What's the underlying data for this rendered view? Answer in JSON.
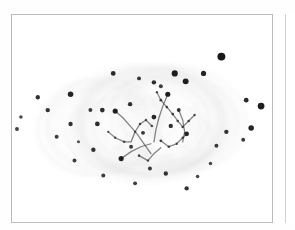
{
  "figure": {
    "title": "",
    "caption": "",
    "background_color": "#ffffff",
    "frame_color": "#b9bbbd",
    "ink_color": "#1a1a1a",
    "polarity": "negative",
    "panel_count": 2,
    "frame": {
      "x": 11,
      "y": 14,
      "width": 262,
      "height": 209
    },
    "adjacent_panel_edge_x": 285
  },
  "chart_data": {
    "type": "scatter",
    "title": "",
    "subtitle": "",
    "xlabel": "",
    "ylabel": "",
    "xlim": [
      0,
      262
    ],
    "ylim": [
      0,
      209
    ],
    "grid": false,
    "legend": "none",
    "axes_visible": false,
    "tick_labels_x": [],
    "tick_labels_y": [],
    "annotations": [],
    "series": [
      {
        "name": "point-sources",
        "marker": "filled-circle",
        "color": "#111111",
        "points": [
          {
            "x": 211,
            "y": 42,
            "r": 4.0,
            "o": 0.95
          },
          {
            "x": 164,
            "y": 59,
            "r": 3.1,
            "o": 0.92
          },
          {
            "x": 193,
            "y": 59,
            "r": 2.6,
            "o": 0.9
          },
          {
            "x": 175,
            "y": 67,
            "r": 3.0,
            "o": 0.92
          },
          {
            "x": 102,
            "y": 59,
            "r": 2.4,
            "o": 0.88
          },
          {
            "x": 128,
            "y": 64,
            "r": 2.0,
            "o": 0.82
          },
          {
            "x": 143,
            "y": 68,
            "r": 2.2,
            "o": 0.86
          },
          {
            "x": 150,
            "y": 72,
            "r": 2.0,
            "o": 0.8
          },
          {
            "x": 157,
            "y": 80,
            "r": 2.6,
            "o": 0.9
          },
          {
            "x": 59,
            "y": 80,
            "r": 2.8,
            "o": 0.9
          },
          {
            "x": 26,
            "y": 83,
            "r": 2.2,
            "o": 0.85
          },
          {
            "x": 236,
            "y": 86,
            "r": 2.4,
            "o": 0.88
          },
          {
            "x": 251,
            "y": 92,
            "r": 3.4,
            "o": 0.93
          },
          {
            "x": 79,
            "y": 96,
            "r": 2.0,
            "o": 0.8
          },
          {
            "x": 36,
            "y": 96,
            "r": 2.2,
            "o": 0.84
          },
          {
            "x": 9,
            "y": 103,
            "r": 1.8,
            "o": 0.75
          },
          {
            "x": 59,
            "y": 110,
            "r": 2.2,
            "o": 0.84
          },
          {
            "x": 91,
            "y": 96,
            "r": 2.4,
            "o": 0.86
          },
          {
            "x": 5,
            "y": 115,
            "r": 2.0,
            "o": 0.78
          },
          {
            "x": 45,
            "y": 123,
            "r": 2.0,
            "o": 0.8
          },
          {
            "x": 86,
            "y": 110,
            "r": 2.4,
            "o": 0.86
          },
          {
            "x": 104,
            "y": 97,
            "r": 2.6,
            "o": 0.9
          },
          {
            "x": 119,
            "y": 90,
            "r": 2.2,
            "o": 0.85
          },
          {
            "x": 143,
            "y": 103,
            "r": 2.4,
            "o": 0.88
          },
          {
            "x": 132,
            "y": 119,
            "r": 2.0,
            "o": 0.82
          },
          {
            "x": 176,
            "y": 120,
            "r": 2.4,
            "o": 0.88
          },
          {
            "x": 216,
            "y": 118,
            "r": 2.2,
            "o": 0.84
          },
          {
            "x": 241,
            "y": 114,
            "r": 2.8,
            "o": 0.9
          },
          {
            "x": 233,
            "y": 126,
            "r": 2.0,
            "o": 0.8
          },
          {
            "x": 206,
            "y": 132,
            "r": 2.0,
            "o": 0.8
          },
          {
            "x": 82,
            "y": 136,
            "r": 2.2,
            "o": 0.84
          },
          {
            "x": 63,
            "y": 147,
            "r": 2.0,
            "o": 0.8
          },
          {
            "x": 110,
            "y": 145,
            "r": 2.6,
            "o": 0.9
          },
          {
            "x": 139,
            "y": 155,
            "r": 2.0,
            "o": 0.8
          },
          {
            "x": 155,
            "y": 160,
            "r": 2.2,
            "o": 0.84
          },
          {
            "x": 92,
            "y": 162,
            "r": 2.0,
            "o": 0.8
          },
          {
            "x": 176,
            "y": 175,
            "r": 2.2,
            "o": 0.84
          },
          {
            "x": 187,
            "y": 163,
            "r": 1.8,
            "o": 0.76
          },
          {
            "x": 124,
            "y": 170,
            "r": 2.0,
            "o": 0.8
          },
          {
            "x": 200,
            "y": 150,
            "r": 1.8,
            "o": 0.74
          },
          {
            "x": 67,
            "y": 128,
            "r": 1.6,
            "o": 0.7
          },
          {
            "x": 120,
            "y": 133,
            "r": 2.0,
            "o": 0.8
          },
          {
            "x": 160,
            "y": 112,
            "r": 2.2,
            "o": 0.85
          },
          {
            "x": 168,
            "y": 96,
            "r": 2.0,
            "o": 0.8
          }
        ]
      },
      {
        "name": "filament-knots",
        "marker": "small-dot",
        "color": "#2a2a2a",
        "points": [
          {
            "x": 150,
            "y": 86,
            "r": 1.4,
            "o": 0.85
          },
          {
            "x": 156,
            "y": 93,
            "r": 1.3,
            "o": 0.82
          },
          {
            "x": 162,
            "y": 100,
            "r": 1.4,
            "o": 0.84
          },
          {
            "x": 167,
            "y": 107,
            "r": 1.3,
            "o": 0.8
          },
          {
            "x": 172,
            "y": 113,
            "r": 1.3,
            "o": 0.8
          },
          {
            "x": 146,
            "y": 78,
            "r": 1.2,
            "o": 0.78
          },
          {
            "x": 178,
            "y": 107,
            "r": 1.3,
            "o": 0.8
          },
          {
            "x": 184,
            "y": 101,
            "r": 1.2,
            "o": 0.76
          },
          {
            "x": 141,
            "y": 112,
            "r": 1.3,
            "o": 0.8
          },
          {
            "x": 135,
            "y": 106,
            "r": 1.2,
            "o": 0.78
          },
          {
            "x": 129,
            "y": 110,
            "r": 1.3,
            "o": 0.8
          },
          {
            "x": 124,
            "y": 118,
            "r": 1.2,
            "o": 0.76
          },
          {
            "x": 150,
            "y": 127,
            "r": 1.4,
            "o": 0.84
          },
          {
            "x": 158,
            "y": 133,
            "r": 1.3,
            "o": 0.8
          },
          {
            "x": 166,
            "y": 130,
            "r": 1.2,
            "o": 0.78
          },
          {
            "x": 172,
            "y": 124,
            "r": 1.2,
            "o": 0.76
          },
          {
            "x": 113,
            "y": 128,
            "r": 1.3,
            "o": 0.8
          },
          {
            "x": 104,
            "y": 124,
            "r": 1.2,
            "o": 0.76
          },
          {
            "x": 97,
            "y": 118,
            "r": 1.2,
            "o": 0.74
          },
          {
            "x": 128,
            "y": 142,
            "r": 1.3,
            "o": 0.8
          },
          {
            "x": 137,
            "y": 147,
            "r": 1.2,
            "o": 0.78
          }
        ]
      }
    ],
    "shells": [
      {
        "name": "outer-shell-left",
        "cx": 88,
        "cy": 113,
        "rx": 62,
        "ry": 48,
        "rot": -8,
        "opacity": 0.16
      },
      {
        "name": "outer-shell-right",
        "cx": 168,
        "cy": 105,
        "rx": 68,
        "ry": 52,
        "rot": 6,
        "opacity": 0.15
      },
      {
        "name": "upper-arc",
        "cx": 140,
        "cy": 108,
        "rx": 58,
        "ry": 44,
        "rot": -2,
        "opacity": 0.18
      },
      {
        "name": "lower-arc",
        "cx": 128,
        "cy": 122,
        "rx": 74,
        "ry": 40,
        "rot": 4,
        "opacity": 0.12
      },
      {
        "name": "faint-halo",
        "cx": 132,
        "cy": 110,
        "rx": 96,
        "ry": 58,
        "rot": 0,
        "opacity": 0.08
      }
    ],
    "core": {
      "name": "central-emission-core",
      "cx": 140,
      "cy": 108,
      "rx": 46,
      "ry": 38,
      "peak_opacity": 0.9
    }
  },
  "labels": {
    "plate_name": "plate-image",
    "panel_a": "panel-a",
    "panel_b": "panel-b"
  }
}
